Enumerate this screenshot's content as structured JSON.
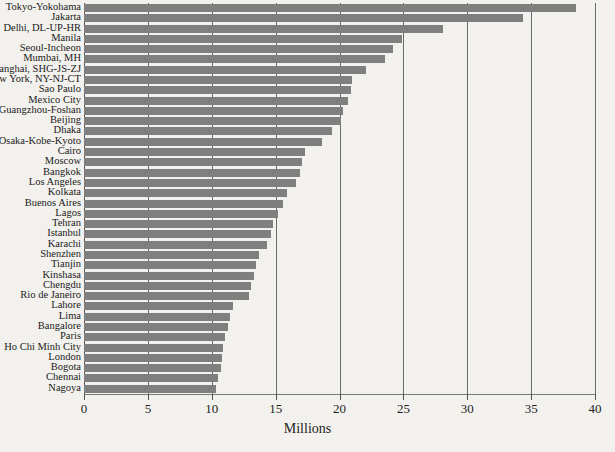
{
  "chart_data": {
    "type": "bar",
    "orientation": "horizontal",
    "title": "",
    "xlabel": "Millions",
    "ylabel": "",
    "xlim": [
      0,
      40
    ],
    "xticks": [
      0,
      5,
      10,
      15,
      20,
      25,
      30,
      35,
      40
    ],
    "xtick_labels": [
      "0",
      "5",
      "10",
      "15",
      "20",
      "25",
      "30",
      "35",
      "40"
    ],
    "grid": true,
    "grid_axis": "x",
    "legend": false,
    "bar_color": "#7f7f7f",
    "background_color": "#f2f1ed",
    "categories": [
      "Tokyo-Yokohama",
      "Jakarta",
      "Delhi, DL-UP-HR",
      "Manila",
      "Seoul-Incheon",
      "Mumbai, MH",
      "Shanghai, SHG-JS-ZJ",
      "New York, NY-NJ-CT",
      "Sao Paulo",
      "Mexico City",
      "Guangzhou-Foshan",
      "Beijing",
      "Dhaka",
      "Osaka-Kobe-Kyoto",
      "Cairo",
      "Moscow",
      "Bangkok",
      "Los Angeles",
      "Kolkata",
      "Buenos Aires",
      "Lagos",
      "Tehran",
      "Istanbul",
      "Karachi",
      "Shenzhen",
      "Tianjin",
      "Kinshasa",
      "Chengdu",
      "Rio de Janeiro",
      "Lahore",
      "Lima",
      "Bangalore",
      "Paris",
      "Ho Chi Minh City",
      "London",
      "Bogota",
      "Chennai",
      "Nagoya"
    ],
    "values": [
      38.5,
      34.4,
      28.1,
      24.9,
      24.2,
      23.6,
      22.1,
      21.0,
      20.9,
      20.7,
      20.3,
      20.1,
      19.4,
      18.6,
      17.3,
      17.1,
      16.9,
      16.6,
      15.9,
      15.6,
      15.2,
      14.8,
      14.6,
      14.3,
      13.7,
      13.5,
      13.3,
      13.1,
      12.9,
      11.7,
      11.4,
      11.3,
      11.0,
      10.9,
      10.8,
      10.7,
      10.5,
      10.3
    ]
  }
}
